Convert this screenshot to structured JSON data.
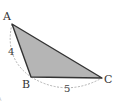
{
  "diagram": {
    "type": "geometry-triangle",
    "fill_color": "#b5b5b5",
    "stroke_color": "#333333",
    "arc_color": "#9a9a9a",
    "vertices": [
      {
        "label": "A",
        "x": 12,
        "y": 24
      },
      {
        "label": "B",
        "x": 31,
        "y": 77
      },
      {
        "label": "C",
        "x": 102,
        "y": 78
      }
    ],
    "side_labels": [
      {
        "side": "AB",
        "value": "4"
      },
      {
        "side": "BC",
        "value": "5"
      }
    ],
    "footnote_mark": "A"
  }
}
